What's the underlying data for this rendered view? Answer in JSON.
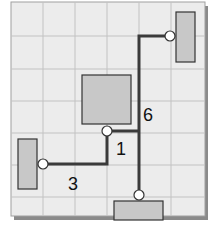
{
  "diagram": {
    "type": "grid-layout-connection-diagram",
    "colors": {
      "board": "#ececec",
      "grid": "#bdbdbd",
      "board_border": "#9a9a9a",
      "shadow": "#8a8a8a",
      "component_fill": "#c8c8c8",
      "component_stroke": "#333333",
      "wire": "#3a3a3a",
      "node_fill": "#ffffff",
      "node_stroke": "#333333",
      "label": "#111111"
    },
    "components": [
      {
        "id": "top-right-component",
        "orientation": "vertical"
      },
      {
        "id": "center-component",
        "orientation": "square"
      },
      {
        "id": "left-component",
        "orientation": "vertical"
      },
      {
        "id": "bottom-component",
        "orientation": "horizontal"
      }
    ],
    "connections": [
      {
        "from": "top-right-component",
        "to": "bottom-component"
      },
      {
        "from": "center-component",
        "to": "main-trunk"
      },
      {
        "from": "center-component",
        "to": "left-component"
      }
    ],
    "labels": {
      "segment_6": "6",
      "segment_1": "1",
      "segment_3": "3"
    }
  }
}
